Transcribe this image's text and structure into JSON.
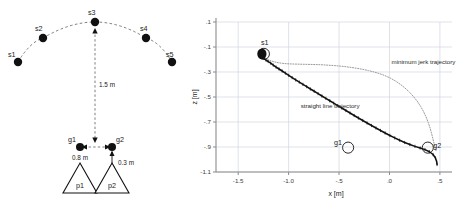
{
  "figure": {
    "panels": [
      "setup-diagram",
      "trajectory-plot"
    ]
  },
  "left_diagram": {
    "name": "experimental-setup-diagram",
    "start_nodes": [
      {
        "id": "s1",
        "label": "s1",
        "x": 18,
        "y": 62
      },
      {
        "id": "s2",
        "label": "s2",
        "x": 43,
        "y": 38
      },
      {
        "id": "s3",
        "label": "s3",
        "x": 95,
        "y": 22
      },
      {
        "id": "s4",
        "label": "s4",
        "x": 146,
        "y": 38
      },
      {
        "id": "s5",
        "label": "s5",
        "x": 172,
        "y": 62
      }
    ],
    "goal_nodes": [
      {
        "id": "g1",
        "label": "g1",
        "x": 80,
        "y": 147
      },
      {
        "id": "g2",
        "label": "g2",
        "x": 112,
        "y": 147
      }
    ],
    "persons": [
      {
        "id": "p1",
        "label": "p1",
        "cx": 80,
        "cy": 182
      },
      {
        "id": "p2",
        "label": "p2",
        "cx": 112,
        "cy": 182
      }
    ],
    "dimensions": [
      {
        "id": "vertical-distance",
        "label": "1.5 m"
      },
      {
        "id": "goal-separation",
        "label": "0.8 m"
      },
      {
        "id": "goal-person-offset",
        "label": "0.3 m"
      }
    ]
  },
  "chart_data": {
    "type": "line",
    "title": "",
    "xlabel": "x [m]",
    "ylabel": "z [m]",
    "xlim": [
      -1.72,
      0.62
    ],
    "ylim": [
      -1.1,
      0.1
    ],
    "grid": true,
    "legend_position": "inline-annotations",
    "xticks": [
      -1.5,
      -1.0,
      -0.5,
      0.0,
      0.5
    ],
    "xticklabels": [
      "-1.5",
      "-1.0",
      "-.5",
      ".0",
      ".5"
    ],
    "yticks": [
      0.1,
      -0.1,
      -0.3,
      -0.5,
      -0.7,
      -0.9,
      -1.1
    ],
    "yticklabels": [
      ".1",
      "-.1",
      "-.3",
      "-.5",
      "-.7",
      "-.9",
      "-1.1"
    ],
    "annotations": [
      {
        "id": "anno-minimum-jerk",
        "text": "minimum jerk trajectory",
        "x": 0.02,
        "y": -0.235
      },
      {
        "id": "anno-straight-line",
        "text": "straight line trajectory",
        "x": -0.88,
        "y": -0.585
      },
      {
        "id": "marker-s1",
        "text": "s1",
        "x": -1.275,
        "y": -0.085
      },
      {
        "id": "marker-g1",
        "text": "g1",
        "x": -0.55,
        "y": -0.885
      },
      {
        "id": "marker-g2",
        "text": "g2",
        "x": 0.435,
        "y": -0.905
      }
    ],
    "markers": [
      {
        "id": "s1-circle",
        "x": -1.245,
        "y": -0.155,
        "r": 0.055,
        "filled": false
      },
      {
        "id": "g1-circle",
        "x": -0.41,
        "y": -0.905,
        "r": 0.055,
        "filled": false
      },
      {
        "id": "g2-circle",
        "x": 0.38,
        "y": -0.905,
        "r": 0.055,
        "filled": false
      }
    ],
    "series": [
      {
        "name": "straight line trajectory",
        "color": "#111111",
        "style": "solid-noisy",
        "points": [
          [
            -1.262,
            -0.178
          ],
          [
            -1.243,
            -0.192
          ],
          [
            -1.224,
            -0.205
          ],
          [
            -1.202,
            -0.216
          ],
          [
            -1.178,
            -0.229
          ],
          [
            -1.152,
            -0.245
          ],
          [
            -1.124,
            -0.261
          ],
          [
            -1.095,
            -0.276
          ],
          [
            -1.064,
            -0.292
          ],
          [
            -1.032,
            -0.309
          ],
          [
            -0.999,
            -0.327
          ],
          [
            -0.965,
            -0.345
          ],
          [
            -0.93,
            -0.363
          ],
          [
            -0.894,
            -0.381
          ],
          [
            -0.858,
            -0.399
          ],
          [
            -0.821,
            -0.417
          ],
          [
            -0.784,
            -0.436
          ],
          [
            -0.746,
            -0.454
          ],
          [
            -0.708,
            -0.473
          ],
          [
            -0.67,
            -0.492
          ],
          [
            -0.631,
            -0.511
          ],
          [
            -0.592,
            -0.53
          ],
          [
            -0.553,
            -0.549
          ],
          [
            -0.513,
            -0.569
          ],
          [
            -0.473,
            -0.588
          ],
          [
            -0.432,
            -0.608
          ],
          [
            -0.391,
            -0.628
          ],
          [
            -0.35,
            -0.648
          ],
          [
            -0.308,
            -0.668
          ],
          [
            -0.265,
            -0.688
          ],
          [
            -0.222,
            -0.708
          ],
          [
            -0.178,
            -0.728
          ],
          [
            -0.134,
            -0.748
          ],
          [
            -0.089,
            -0.768
          ],
          [
            -0.043,
            -0.788
          ],
          [
            0.004,
            -0.808
          ],
          [
            0.052,
            -0.827
          ],
          [
            0.101,
            -0.846
          ],
          [
            0.151,
            -0.864
          ],
          [
            0.202,
            -0.88
          ],
          [
            0.253,
            -0.895
          ],
          [
            0.304,
            -0.908
          ],
          [
            0.352,
            -0.921
          ],
          [
            0.396,
            -0.938
          ],
          [
            0.432,
            -0.96
          ],
          [
            0.456,
            -0.988
          ],
          [
            0.468,
            -1.018
          ],
          [
            0.472,
            -1.04
          ]
        ]
      },
      {
        "name": "minimum jerk trajectory",
        "color": "#9a9a9a",
        "style": "dotted",
        "points": [
          [
            -1.252,
            -0.175
          ],
          [
            -1.232,
            -0.188
          ],
          [
            -1.206,
            -0.2
          ],
          [
            -1.175,
            -0.211
          ],
          [
            -1.14,
            -0.219
          ],
          [
            -1.1,
            -0.226
          ],
          [
            -1.058,
            -0.231
          ],
          [
            -1.013,
            -0.234
          ],
          [
            -0.966,
            -0.236
          ],
          [
            -0.917,
            -0.237
          ],
          [
            -0.867,
            -0.238
          ],
          [
            -0.815,
            -0.239
          ],
          [
            -0.762,
            -0.24
          ],
          [
            -0.708,
            -0.241
          ],
          [
            -0.653,
            -0.243
          ],
          [
            -0.598,
            -0.246
          ],
          [
            -0.542,
            -0.249
          ],
          [
            -0.486,
            -0.253
          ],
          [
            -0.43,
            -0.258
          ],
          [
            -0.374,
            -0.264
          ],
          [
            -0.318,
            -0.271
          ],
          [
            -0.262,
            -0.279
          ],
          [
            -0.207,
            -0.289
          ],
          [
            -0.152,
            -0.3
          ],
          [
            -0.098,
            -0.313
          ],
          [
            -0.045,
            -0.329
          ],
          [
            0.007,
            -0.348
          ],
          [
            0.058,
            -0.371
          ],
          [
            0.107,
            -0.398
          ],
          [
            0.154,
            -0.428
          ],
          [
            0.198,
            -0.461
          ],
          [
            0.239,
            -0.497
          ],
          [
            0.276,
            -0.535
          ],
          [
            0.309,
            -0.575
          ],
          [
            0.338,
            -0.617
          ],
          [
            0.363,
            -0.66
          ],
          [
            0.384,
            -0.703
          ],
          [
            0.402,
            -0.747
          ],
          [
            0.417,
            -0.79
          ],
          [
            0.43,
            -0.832
          ],
          [
            0.441,
            -0.87
          ],
          [
            0.452,
            -0.903
          ],
          [
            0.462,
            -0.93
          ]
        ]
      }
    ]
  },
  "colors": {
    "grid": "#d0d6e0",
    "axis": "#8b8b8b",
    "ink": "#111111",
    "minimum_jerk": "#9a9a9a"
  }
}
